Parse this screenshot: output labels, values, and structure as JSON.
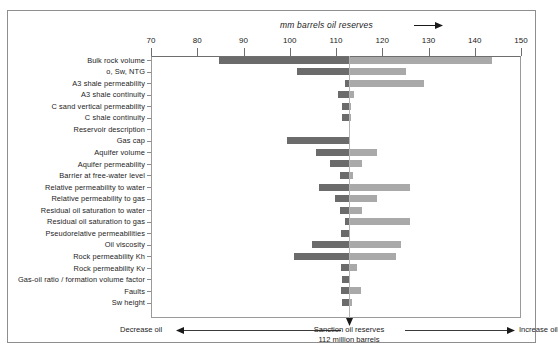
{
  "figure": {
    "axis_title": "mm barrels oil reserves",
    "axis_title_arrow": "right-arrow-icon",
    "footer_left": "Decrease oil",
    "footer_right": "Increase oil",
    "footer_center_line1": "Sanction oil reserves",
    "footer_center_line2": "112 million barrels",
    "colors": {
      "bar_decrease": "#6b6b6b",
      "bar_increase": "#a9a9a9",
      "frame": "#8e8e8e",
      "axis": "#6e6e6e",
      "text": "#1c1c1c"
    }
  },
  "chart_data": {
    "type": "bar",
    "title": "",
    "xlabel": "mm barrels oil reserves",
    "ylabel": "",
    "xlim": [
      70,
      150
    ],
    "xticks": [
      70,
      80,
      90,
      100,
      110,
      120,
      130,
      140,
      150
    ],
    "grid": false,
    "legend_position": "none",
    "base_value": 112.8,
    "orientation": "horizontal-tornado",
    "series": [
      {
        "name": "Decrease oil",
        "color": "#6b6b6b"
      },
      {
        "name": "Increase oil",
        "color": "#a9a9a9"
      }
    ],
    "categories": [
      "Bulk rock volume",
      "o, Sw, NTG",
      "A3 shale permeability",
      "A3 shale continuity",
      "C sand vertical permeability",
      "C shale continuity",
      "Reservoir description",
      "Gas cap",
      "Aquifer volume",
      "Aquifer permeability",
      "Barrier at free-water level",
      "Relative permeability to water",
      "Relative permeability to gas",
      "Residual oil saturation to water",
      "Residual oil saturation to gas",
      "Pseudorelative permeabilities",
      "Oil viscosity",
      "Rock permeability Kh",
      "Rock permeability Kv",
      "Gas-oil ratio / formation volume factor",
      "Faults",
      "Sw height"
    ],
    "low": [
      84.7,
      101.5,
      112.0,
      110.5,
      111.4,
      111.4,
      112.8,
      99.4,
      105.7,
      108.6,
      110.8,
      106.4,
      109.7,
      110.8,
      112.0,
      111.0,
      104.8,
      100.9,
      111.0,
      111.4,
      111.0,
      111.4
    ],
    "high": [
      143.7,
      125.2,
      129.0,
      114.0,
      113.3,
      113.3,
      112.8,
      113.0,
      118.8,
      115.6,
      113.7,
      126.0,
      118.8,
      115.6,
      126.0,
      112.8,
      124.0,
      123.0,
      114.5,
      113.0,
      115.3,
      113.5
    ],
    "note": "low = left (decrease) end, high = right (increase) end, in mm barrels"
  }
}
